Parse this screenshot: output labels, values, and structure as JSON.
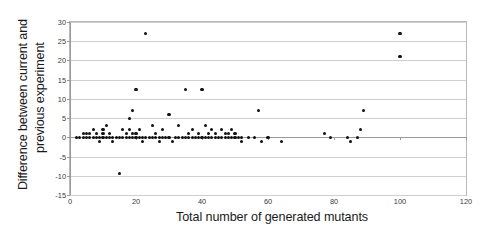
{
  "chart_data": {
    "type": "scatter",
    "title": "",
    "xlabel": "Total number of generated mutants",
    "ylabel_line1": "Difference between current and",
    "ylabel_line2": "previous experiment",
    "xlim": [
      0,
      120
    ],
    "ylim": [
      -15,
      30
    ],
    "xticks": [
      0,
      20,
      40,
      60,
      80,
      100,
      120
    ],
    "yticks": [
      30,
      25,
      20,
      15,
      10,
      5,
      0,
      -5,
      -10,
      -15
    ],
    "grid": "horizontal",
    "legend": "none",
    "marker_color": "#101010",
    "marker_shape": "circle",
    "points": [
      [
        2,
        0
      ],
      [
        3,
        0
      ],
      [
        4,
        0
      ],
      [
        4,
        1
      ],
      [
        5,
        0
      ],
      [
        5,
        1
      ],
      [
        6,
        0
      ],
      [
        6,
        1
      ],
      [
        7,
        0
      ],
      [
        7,
        2
      ],
      [
        8,
        0
      ],
      [
        8,
        1
      ],
      [
        9,
        0
      ],
      [
        9,
        -1
      ],
      [
        10,
        0
      ],
      [
        10,
        1
      ],
      [
        10,
        2
      ],
      [
        11,
        0
      ],
      [
        11,
        3
      ],
      [
        12,
        0
      ],
      [
        12,
        1
      ],
      [
        13,
        0
      ],
      [
        13,
        -1
      ],
      [
        14,
        0
      ],
      [
        15,
        0
      ],
      [
        15,
        -9.5
      ],
      [
        16,
        0
      ],
      [
        16,
        2
      ],
      [
        17,
        0
      ],
      [
        17,
        1
      ],
      [
        18,
        0
      ],
      [
        18,
        2
      ],
      [
        18,
        5
      ],
      [
        19,
        0
      ],
      [
        19,
        1
      ],
      [
        19,
        7
      ],
      [
        20,
        0
      ],
      [
        20,
        1
      ],
      [
        20,
        12.5
      ],
      [
        21,
        0
      ],
      [
        21,
        2
      ],
      [
        22,
        0
      ],
      [
        22,
        -1
      ],
      [
        23,
        0
      ],
      [
        23,
        27
      ],
      [
        24,
        0
      ],
      [
        25,
        0
      ],
      [
        25,
        3
      ],
      [
        26,
        0
      ],
      [
        26,
        1
      ],
      [
        27,
        0
      ],
      [
        27,
        -1
      ],
      [
        28,
        0
      ],
      [
        28,
        2
      ],
      [
        29,
        0
      ],
      [
        30,
        0
      ],
      [
        30,
        6
      ],
      [
        31,
        -1
      ],
      [
        32,
        0
      ],
      [
        33,
        0
      ],
      [
        33,
        3
      ],
      [
        34,
        0
      ],
      [
        35,
        0
      ],
      [
        35,
        12.5
      ],
      [
        36,
        0
      ],
      [
        36,
        1
      ],
      [
        37,
        0
      ],
      [
        37,
        2
      ],
      [
        38,
        0
      ],
      [
        39,
        0
      ],
      [
        39,
        1
      ],
      [
        40,
        0
      ],
      [
        40,
        12.5
      ],
      [
        41,
        0
      ],
      [
        41,
        3
      ],
      [
        42,
        0
      ],
      [
        42,
        1
      ],
      [
        43,
        0
      ],
      [
        43,
        2
      ],
      [
        44,
        0
      ],
      [
        44,
        1
      ],
      [
        45,
        0
      ],
      [
        46,
        0
      ],
      [
        46,
        2
      ],
      [
        47,
        0
      ],
      [
        47,
        1
      ],
      [
        48,
        0
      ],
      [
        48,
        1
      ],
      [
        49,
        0
      ],
      [
        49,
        2
      ],
      [
        50,
        0
      ],
      [
        50,
        1
      ],
      [
        51,
        0
      ],
      [
        52,
        0
      ],
      [
        52,
        -1
      ],
      [
        54,
        0
      ],
      [
        56,
        0
      ],
      [
        57,
        7
      ],
      [
        58,
        -1
      ],
      [
        60,
        0
      ],
      [
        64,
        -1
      ],
      [
        77,
        1
      ],
      [
        79,
        0
      ],
      [
        84,
        0
      ],
      [
        85,
        -1
      ],
      [
        87,
        0
      ],
      [
        88,
        2
      ],
      [
        89,
        7
      ],
      [
        100,
        27
      ],
      [
        100,
        21
      ]
    ]
  }
}
